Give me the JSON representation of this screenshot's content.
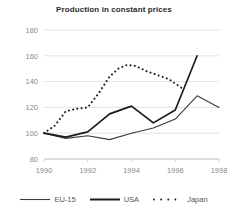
{
  "chart_data": {
    "type": "line",
    "title": "Production in constant prices",
    "xlabel": "",
    "ylabel": "",
    "xlim": [
      1990,
      1998
    ],
    "ylim": [
      80,
      180
    ],
    "grid": true,
    "legend_position": "bottom",
    "xticks": [
      1990,
      1992,
      1994,
      1996,
      1998
    ],
    "yticks": [
      80,
      100,
      120,
      140,
      160,
      180
    ],
    "series": [
      {
        "name": "EU-15",
        "style": "solid-thin",
        "color": "#3a3a3a",
        "x": [
          1990,
          1991,
          1992,
          1993,
          1994,
          1995,
          1996,
          1997,
          1998
        ],
        "values": [
          100,
          96,
          98,
          95,
          100,
          104,
          111,
          129,
          120
        ]
      },
      {
        "name": "USA",
        "style": "solid-thick",
        "color": "#1a1a1a",
        "x": [
          1990,
          1991,
          1992,
          1993,
          1994,
          1995,
          1996,
          1997
        ],
        "values": [
          100,
          97,
          101,
          115,
          121,
          108,
          118,
          160
        ]
      },
      {
        "name": "Japan",
        "style": "dotted",
        "color": "#1a1a1a",
        "x": [
          1990,
          1990.5,
          1991,
          1991.5,
          1992,
          1992.5,
          1993,
          1993.4,
          1993.8,
          1994.2,
          1994.7,
          1995.2,
          1995.7,
          1996.3
        ],
        "values": [
          100,
          106,
          117,
          119,
          120,
          131,
          144,
          150,
          153,
          152,
          148,
          145,
          142,
          135
        ]
      }
    ]
  },
  "axis": {
    "ytick_labels": [
      "180",
      "160",
      "140",
      "120",
      "100",
      "80"
    ],
    "xtick_labels": [
      "1990",
      "1992",
      "1994",
      "1996",
      "1998"
    ]
  },
  "legend": {
    "items": [
      {
        "label": "EU-15"
      },
      {
        "label": "USA"
      },
      {
        "label": "Japan"
      }
    ]
  }
}
